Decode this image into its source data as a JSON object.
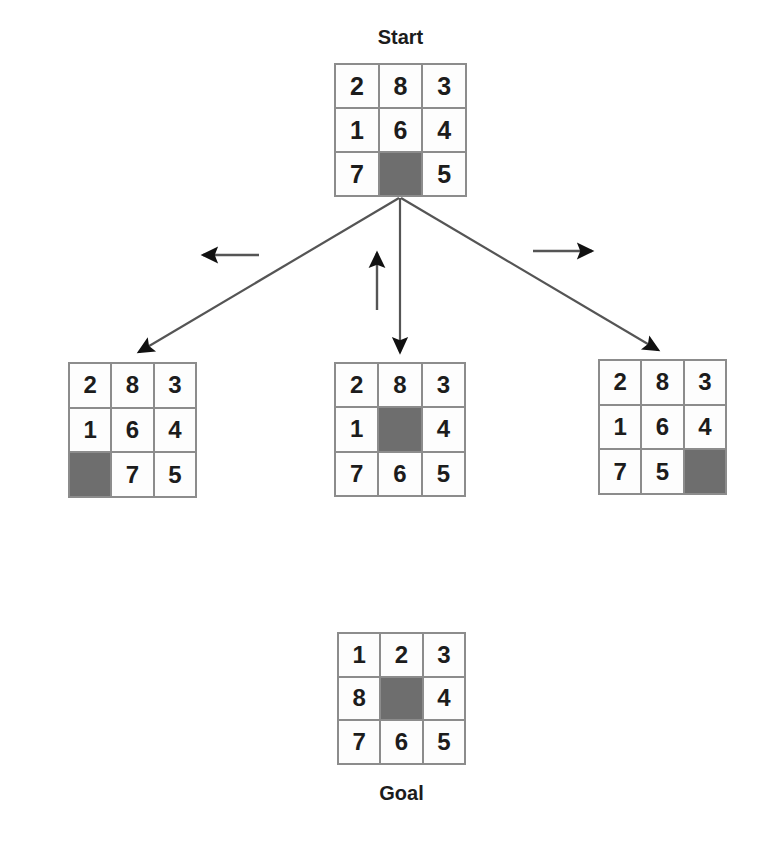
{
  "diagram": {
    "colors": {
      "border": "#8c8c8c",
      "tile_background": "#fdfdfd",
      "blank_tile": "#6e6e6e",
      "number": "#1c1c1c",
      "edge": "#555555",
      "arrow": "#111111"
    }
  },
  "start": {
    "label": "Start",
    "rows": [
      [
        "2",
        "8",
        "3"
      ],
      [
        "1",
        "6",
        "4"
      ],
      [
        "7",
        "",
        "5"
      ]
    ],
    "blank": {
      "row": 2,
      "col": 1
    }
  },
  "children": [
    {
      "name": "left-child",
      "move": "left",
      "move_arrow_glyph": "←",
      "rows": [
        [
          "2",
          "8",
          "3"
        ],
        [
          "1",
          "6",
          "4"
        ],
        [
          "",
          "7",
          "5"
        ]
      ],
      "blank": {
        "row": 2,
        "col": 0
      }
    },
    {
      "name": "middle-child",
      "move": "up",
      "move_arrow_glyph": "↑",
      "rows": [
        [
          "2",
          "8",
          "3"
        ],
        [
          "1",
          "",
          "4"
        ],
        [
          "7",
          "6",
          "5"
        ]
      ],
      "blank": {
        "row": 1,
        "col": 1
      }
    },
    {
      "name": "right-child",
      "move": "right",
      "move_arrow_glyph": "→",
      "rows": [
        [
          "2",
          "8",
          "3"
        ],
        [
          "1",
          "6",
          "4"
        ],
        [
          "7",
          "5",
          ""
        ]
      ],
      "blank": {
        "row": 2,
        "col": 2
      }
    }
  ],
  "goal": {
    "label": "Goal",
    "rows": [
      [
        "1",
        "2",
        "3"
      ],
      [
        "8",
        "",
        "4"
      ],
      [
        "7",
        "6",
        "5"
      ]
    ],
    "blank": {
      "row": 1,
      "col": 1
    }
  }
}
